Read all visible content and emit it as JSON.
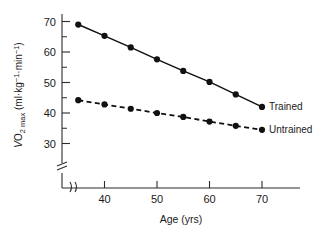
{
  "chart_data": {
    "type": "line",
    "title": "",
    "xlabel": "Age (yrs)",
    "ylabel": "VO2 max (ml·kg⁻¹·min⁻¹)",
    "ylabel_parts": {
      "v_symbol": "V",
      "o_symbol": "O",
      "o_subscript": "2 max",
      "units_open": " (ml·kg",
      "units_sup1": "−1",
      "units_mid": "·min",
      "units_sup2": "−1",
      "units_close": ")"
    },
    "x": [
      35,
      40,
      45,
      50,
      55,
      60,
      65,
      70
    ],
    "xlim": [
      33,
      72
    ],
    "ylim": [
      28,
      72
    ],
    "xticks": [
      40,
      50,
      60,
      70
    ],
    "xtick_labels": [
      "40",
      "50",
      "60",
      "70"
    ],
    "yticks": [
      30,
      40,
      50,
      60,
      70
    ],
    "ytick_labels": [
      "30",
      "40",
      "50",
      "60",
      "70"
    ],
    "y_minor_ticks": [
      35,
      45,
      55,
      65
    ],
    "grid": false,
    "axis_break_x": true,
    "axis_break_y": true,
    "legend_position": "right-inline",
    "series": [
      {
        "name": "Trained",
        "style": "solid",
        "marker": "filled-circle",
        "label_x": 70,
        "values": [
          69.0,
          65.3,
          61.5,
          57.6,
          53.8,
          50.2,
          46.1,
          42.0
        ]
      },
      {
        "name": "Untrained",
        "style": "dashed",
        "marker": "filled-circle",
        "label_x": 70,
        "values": [
          44.2,
          42.8,
          41.4,
          40.0,
          38.7,
          37.2,
          35.8,
          34.5
        ]
      }
    ],
    "colors": {
      "line": "#111111",
      "marker": "#111111",
      "axis": "#2b2b2b",
      "text": "#1a1a1a",
      "background": "#ffffff"
    }
  }
}
